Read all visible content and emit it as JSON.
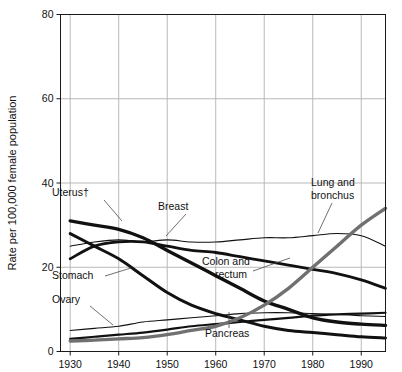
{
  "chart_data": {
    "type": "line",
    "title": "",
    "xlabel": "",
    "ylabel": "Rate per 100,000 female population",
    "xlim": [
      1928,
      1995
    ],
    "ylim": [
      0,
      80
    ],
    "yticks": [
      0,
      20,
      40,
      60,
      80
    ],
    "xticks": [
      1930,
      1940,
      1950,
      1960,
      1970,
      1980,
      1990
    ],
    "grid": true,
    "legend_position": "inline-annotations",
    "x": [
      1930,
      1935,
      1940,
      1945,
      1950,
      1955,
      1960,
      1965,
      1970,
      1975,
      1980,
      1985,
      1990,
      1995
    ],
    "series": [
      {
        "name": "Uterus",
        "label": "Uterus†",
        "color": "#111111",
        "width": 3.4,
        "values": [
          31,
          30,
          29,
          27,
          24,
          21,
          18,
          15,
          12,
          10,
          8,
          7,
          6.5,
          6.2
        ]
      },
      {
        "name": "Breast",
        "label": "Breast",
        "color": "#111111",
        "width": 1.1,
        "values": [
          25,
          26,
          26.5,
          26,
          26.5,
          26,
          26,
          26.5,
          27,
          27,
          27.5,
          28,
          27.5,
          25
        ]
      },
      {
        "name": "Colon and rectum",
        "label": "Colon and rectum",
        "color": "#111111",
        "width": 2.8,
        "values": [
          22,
          25,
          26,
          26,
          25,
          24,
          23.5,
          22.5,
          21.5,
          20.5,
          19.5,
          18.5,
          17,
          15
        ]
      },
      {
        "name": "Stomach",
        "label": "Stomach",
        "color": "#111111",
        "width": 3.0,
        "values": [
          28,
          25,
          22,
          18,
          14,
          11,
          9,
          7.5,
          6,
          5,
          4.5,
          4,
          3.5,
          3.2
        ]
      },
      {
        "name": "Ovary",
        "label": "Ovary",
        "color": "#111111",
        "width": 1.1,
        "values": [
          5,
          5.5,
          6,
          7,
          7.5,
          8,
          8.5,
          9,
          9.2,
          9.2,
          9,
          8.8,
          8.5,
          8.3
        ]
      },
      {
        "name": "Pancreas",
        "label": "Pancreas",
        "color": "#111111",
        "width": 2.2,
        "values": [
          3,
          3.5,
          4,
          4.5,
          5.2,
          6,
          6.5,
          7,
          7.5,
          8,
          8.5,
          8.8,
          9,
          9.2
        ]
      },
      {
        "name": "Lung and bronchus",
        "label": "Lung and bronchus",
        "color": "#707070",
        "width": 3.4,
        "values": [
          2.5,
          2.7,
          3,
          3.3,
          4,
          5,
          6,
          8,
          11,
          15,
          20,
          25,
          30,
          34
        ]
      }
    ],
    "annotations": [
      {
        "text": "Uterus†",
        "x": 52,
        "y": 196
      },
      {
        "text": "Breast",
        "x": 158,
        "y": 210
      },
      {
        "text": "Colon and",
        "x": 202,
        "y": 265
      },
      {
        "text": "rectum",
        "x": 215,
        "y": 278
      },
      {
        "text": "Lung and",
        "x": 311,
        "y": 186
      },
      {
        "text": "bronchus",
        "x": 311,
        "y": 199
      },
      {
        "text": "Stomach",
        "x": 52,
        "y": 279
      },
      {
        "text": "Ovary",
        "x": 52,
        "y": 303
      },
      {
        "text": "Pancreas",
        "x": 205,
        "y": 337
      }
    ]
  },
  "axis": {
    "y_tick_labels": [
      "0",
      "20",
      "40",
      "60",
      "80"
    ],
    "x_tick_labels": [
      "1930",
      "1940",
      "1950",
      "1960",
      "1970",
      "1980",
      "1990"
    ],
    "y_axis_title": "Rate per 100,000 female population"
  }
}
